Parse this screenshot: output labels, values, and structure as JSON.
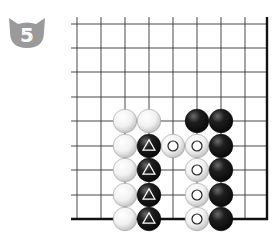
{
  "problem": {
    "number": "5",
    "badge_color": "#9a9a9a"
  },
  "board": {
    "line_color": "#333333",
    "border_color": "#111111",
    "columns_x": [
      77,
      101,
      125,
      149,
      173,
      197,
      221,
      245
    ],
    "right_border_x": 267,
    "rows_y": [
      24,
      48,
      72,
      97,
      121,
      146,
      170,
      195
    ],
    "bottom_border_y": 219,
    "stones": [
      {
        "color": "white",
        "col": 2,
        "row": 4,
        "mark": ""
      },
      {
        "color": "white",
        "col": 3,
        "row": 4,
        "mark": ""
      },
      {
        "color": "black",
        "col": 5,
        "row": 4,
        "mark": ""
      },
      {
        "color": "black",
        "col": 6,
        "row": 4,
        "mark": ""
      },
      {
        "color": "white",
        "col": 2,
        "row": 5,
        "mark": ""
      },
      {
        "color": "black",
        "col": 3,
        "row": 5,
        "mark": "triangle"
      },
      {
        "color": "white",
        "col": 4,
        "row": 5,
        "mark": "circle"
      },
      {
        "color": "white",
        "col": 5,
        "row": 5,
        "mark": "circle"
      },
      {
        "color": "black",
        "col": 6,
        "row": 5,
        "mark": ""
      },
      {
        "color": "white",
        "col": 2,
        "row": 6,
        "mark": ""
      },
      {
        "color": "black",
        "col": 3,
        "row": 6,
        "mark": "triangle"
      },
      {
        "color": "white",
        "col": 5,
        "row": 6,
        "mark": "circle"
      },
      {
        "color": "black",
        "col": 6,
        "row": 6,
        "mark": ""
      },
      {
        "color": "white",
        "col": 2,
        "row": 7,
        "mark": ""
      },
      {
        "color": "black",
        "col": 3,
        "row": 7,
        "mark": "triangle"
      },
      {
        "color": "white",
        "col": 5,
        "row": 7,
        "mark": "circle"
      },
      {
        "color": "black",
        "col": 6,
        "row": 7,
        "mark": ""
      },
      {
        "color": "white",
        "col": 2,
        "row": 8,
        "mark": ""
      },
      {
        "color": "black",
        "col": 3,
        "row": 8,
        "mark": "triangle"
      },
      {
        "color": "white",
        "col": 5,
        "row": 8,
        "mark": "circle"
      },
      {
        "color": "black",
        "col": 6,
        "row": 8,
        "mark": ""
      }
    ]
  }
}
